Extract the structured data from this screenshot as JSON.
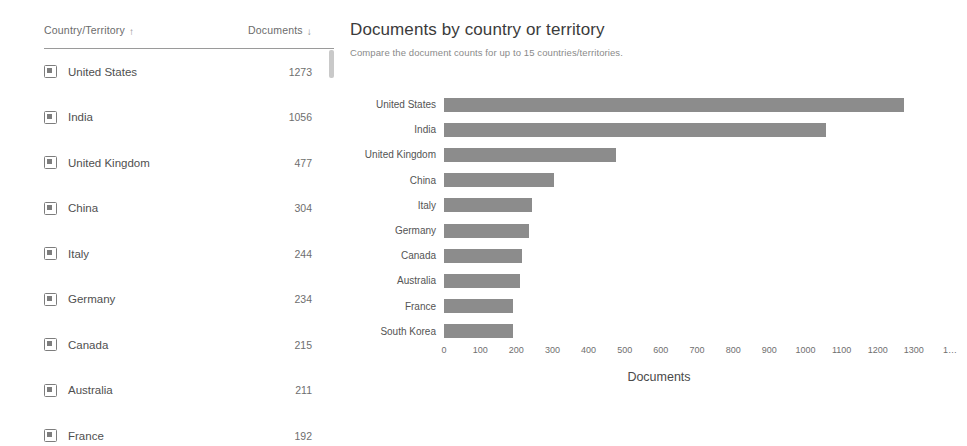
{
  "table": {
    "columns": {
      "country": "Country/Territory",
      "documents": "Documents",
      "country_sort_icon": "sort-ascending-arrow-icon",
      "documents_sort_icon": "sort-descending-arrow-icon",
      "country_sort_glyph": "↑",
      "documents_sort_glyph": "↓"
    },
    "rows": [
      {
        "country": "United States",
        "documents": "1273"
      },
      {
        "country": "India",
        "documents": "1056"
      },
      {
        "country": "United Kingdom",
        "documents": "477"
      },
      {
        "country": "China",
        "documents": "304"
      },
      {
        "country": "Italy",
        "documents": "244"
      },
      {
        "country": "Germany",
        "documents": "234"
      },
      {
        "country": "Canada",
        "documents": "215"
      },
      {
        "country": "Australia",
        "documents": "211"
      },
      {
        "country": "France",
        "documents": "192"
      }
    ]
  },
  "chart_panel": {
    "title": "Documents by country or territory",
    "subtitle": "Compare the document counts for up to 15 countries/territories."
  },
  "chart_data": {
    "type": "bar",
    "orientation": "horizontal",
    "title": "Documents by country or territory",
    "subtitle": "Compare the document counts for up to 15 countries/territories.",
    "xlabel": "Documents",
    "ylabel": "",
    "categories": [
      "United States",
      "India",
      "United Kingdom",
      "China",
      "Italy",
      "Germany",
      "Canada",
      "Australia",
      "France",
      "South Korea"
    ],
    "values": [
      1273,
      1056,
      477,
      304,
      244,
      234,
      215,
      211,
      192,
      190
    ],
    "xlim": [
      0,
      1400
    ],
    "xticks": [
      0,
      100,
      200,
      300,
      400,
      500,
      600,
      700,
      800,
      900,
      1000,
      1100,
      1200,
      1300,
      1400
    ],
    "xtick_labels": [
      "0",
      "100",
      "200",
      "300",
      "400",
      "500",
      "600",
      "700",
      "800",
      "900",
      "1000",
      "1100",
      "1200",
      "1300",
      "1…"
    ],
    "grid": false,
    "legend": null,
    "bar_color": "#8c8c8c"
  },
  "colors": {
    "bar": "#8c8c8c",
    "text": "#4a4a4a",
    "muted_text": "#8a8a8a",
    "rule": "#9a9a9a",
    "scrollbar": "#c9c9c9"
  }
}
